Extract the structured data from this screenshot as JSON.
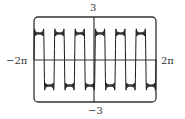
{
  "chart_data": {
    "type": "line",
    "title": "",
    "xlabel": "",
    "ylabel": "",
    "xlim": [
      -6.2832,
      6.2832
    ],
    "ylim": [
      -3,
      3
    ],
    "grid": false,
    "legend": null,
    "tick_labels": {
      "x_min": "−2π",
      "x_max": "2π",
      "y_max": "3",
      "y_min": "−3"
    },
    "series": [
      {
        "name": "Fourier partial sum approximating square wave",
        "description": "Square-wave-like curve with Gibbs overshoot ripples, amplitude about ±2, period about 2π/3 (roughly 6 cycles across the window)",
        "amplitude": 2,
        "period": 2.0944,
        "x": [
          -6.28,
          -5.24,
          -4.19,
          -3.14,
          -2.09,
          -1.05,
          0,
          1.05,
          2.09,
          3.14,
          4.19,
          5.24,
          6.28
        ],
        "y": [
          -2,
          2,
          -2,
          2,
          -2,
          2,
          0,
          2,
          -2,
          2,
          -2,
          2,
          -2
        ]
      }
    ],
    "colors": {
      "curve": "#1a1a1a",
      "frame": "#333333",
      "background": "#ffffff"
    }
  }
}
